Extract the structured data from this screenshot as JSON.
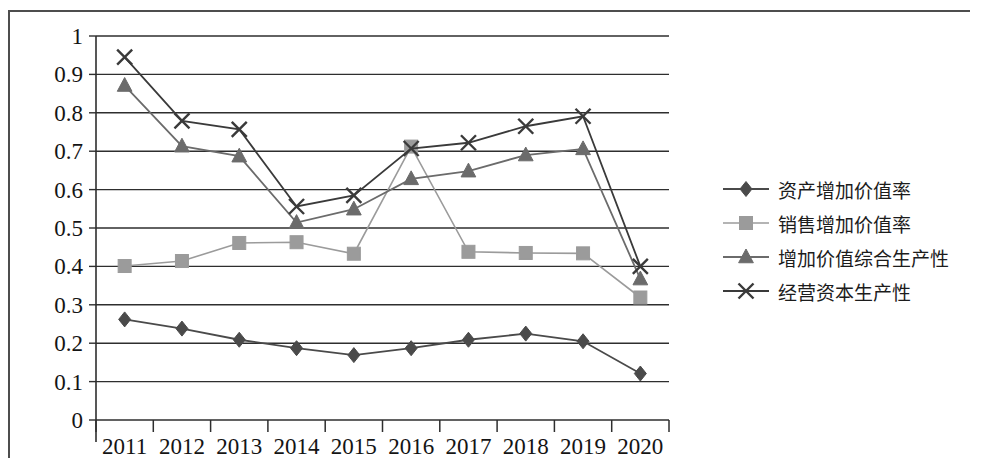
{
  "chart_data": {
    "type": "line",
    "title": "",
    "xlabel": "",
    "ylabel": "",
    "categories": [
      "2011",
      "2012",
      "2013",
      "2014",
      "2015",
      "2016",
      "2017",
      "2018",
      "2019",
      "2020"
    ],
    "ylim": [
      0,
      1
    ],
    "ytick_labels": [
      "1",
      "0.9",
      "0.8",
      "0.7",
      "0.6",
      "0.5",
      "0.4",
      "0.3",
      "0.2",
      "0.1",
      "0"
    ],
    "ytick_values": [
      1,
      0.9,
      0.8,
      0.7,
      0.6,
      0.5,
      0.4,
      0.3,
      0.2,
      0.1,
      0
    ],
    "grid": "horizontal",
    "legend_position": "right",
    "series": [
      {
        "name": "资产增加价值率",
        "marker": "diamond",
        "color": "#4a4a4a",
        "values": [
          0.262,
          0.238,
          0.209,
          0.187,
          0.169,
          0.187,
          0.209,
          0.225,
          0.205,
          0.121
        ]
      },
      {
        "name": "销售增加价值率",
        "marker": "square",
        "color": "#9b9b9b",
        "values": [
          0.401,
          0.414,
          0.461,
          0.463,
          0.433,
          0.712,
          0.438,
          0.435,
          0.434,
          0.319
        ]
      },
      {
        "name": "增加价值综合生产性",
        "marker": "triangle",
        "color": "#6b6b6b",
        "values": [
          0.871,
          0.713,
          0.687,
          0.514,
          0.549,
          0.628,
          0.648,
          0.69,
          0.706,
          0.367
        ]
      },
      {
        "name": "经営资本生产性",
        "marker": "cross",
        "color": "#3a3a3a",
        "values": [
          0.945,
          0.779,
          0.757,
          0.556,
          0.585,
          0.707,
          0.722,
          0.765,
          0.791,
          0.4
        ]
      }
    ]
  },
  "legend": {
    "items": [
      {
        "label": "资产增加价值率",
        "marker": "diamond",
        "color": "#4a4a4a"
      },
      {
        "label": "销售增加价值率",
        "marker": "square",
        "color": "#9b9b9b"
      },
      {
        "label": "增加价值综合生产性",
        "marker": "triangle",
        "color": "#6b6b6b"
      },
      {
        "label": "经营资本生产性",
        "marker": "cross",
        "color": "#3a3a3a"
      }
    ]
  }
}
